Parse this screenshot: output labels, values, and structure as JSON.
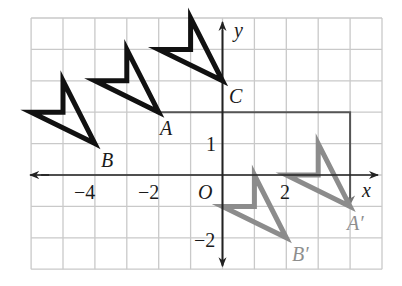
{
  "colors": {
    "grid": "#c9c9c9",
    "axis": "#222222",
    "original": "#111111",
    "image": "#8c8c8c",
    "path": "#555555"
  },
  "axes": {
    "x_label": "x",
    "y_label": "y",
    "origin_label": "O",
    "x_range": [
      -6,
      5
    ],
    "y_range": [
      -3,
      5
    ]
  },
  "tick_labels": {
    "x_neg4": "−4",
    "x_neg2": "−2",
    "x_2": "2",
    "y_1": "1",
    "y_neg2": "−2"
  },
  "points": {
    "A": {
      "label": "A",
      "coords": [
        -2,
        2
      ]
    },
    "B": {
      "label": "B",
      "coords": [
        -4,
        1
      ]
    },
    "C": {
      "label": "C",
      "coords": [
        0,
        3
      ]
    },
    "A_prime": {
      "label": "A′",
      "coords": [
        4,
        -1
      ]
    },
    "B_prime": {
      "label": "B′",
      "coords": [
        2,
        -2
      ]
    }
  },
  "figures": {
    "original_shapes": [
      {
        "tip": [
          -4,
          1
        ],
        "vertices": [
          [
            -4,
            1
          ],
          [
            -6,
            2
          ],
          [
            -5,
            2
          ],
          [
            -5,
            3
          ]
        ]
      },
      {
        "tip": [
          -2,
          2
        ],
        "vertices": [
          [
            -2,
            2
          ],
          [
            -4,
            3
          ],
          [
            -3,
            3
          ],
          [
            -3,
            4
          ]
        ]
      },
      {
        "tip": [
          0,
          3
        ],
        "vertices": [
          [
            0,
            3
          ],
          [
            -2,
            4
          ],
          [
            -1,
            4
          ],
          [
            -1,
            5
          ]
        ]
      }
    ],
    "image_shapes": [
      {
        "tip": [
          2,
          -2
        ],
        "vertices": [
          [
            2,
            -2
          ],
          [
            0,
            -1
          ],
          [
            1,
            -1
          ],
          [
            1,
            0
          ]
        ]
      },
      {
        "tip": [
          4,
          -1
        ],
        "vertices": [
          [
            4,
            -1
          ],
          [
            2,
            0
          ],
          [
            3,
            0
          ],
          [
            3,
            1
          ]
        ]
      }
    ],
    "translation_path": [
      [
        -2,
        2
      ],
      [
        4,
        2
      ],
      [
        4,
        -1
      ]
    ],
    "translation_vector": [
      6,
      -3
    ]
  }
}
